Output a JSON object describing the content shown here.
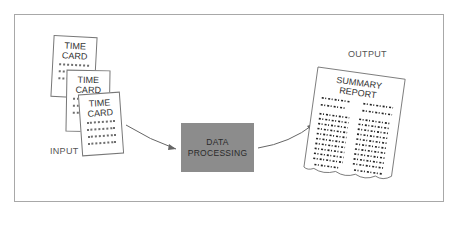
{
  "diagram": {
    "input_label": "INPUT",
    "output_label": "OUTPUT",
    "cards": [
      {
        "line1": "TIME",
        "line2": "CARD"
      },
      {
        "line1": "TIME",
        "line2": "CARD"
      },
      {
        "line1": "TIME",
        "line2": "CARD"
      }
    ],
    "process": {
      "line1": "DATA",
      "line2": "PROCESSING"
    },
    "report": {
      "line1": "SUMMARY",
      "line2": "REPORT"
    },
    "colors": {
      "border": "#a8a8a8",
      "process_fill": "#8c8c8c",
      "ink": "#333333"
    }
  }
}
